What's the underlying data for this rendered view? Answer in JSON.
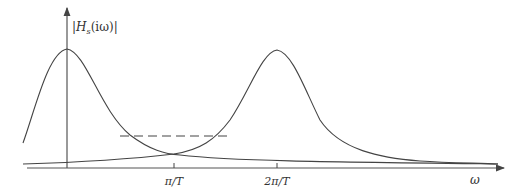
{
  "diagram": {
    "y_axis_label": {
      "bar_open": "|",
      "H": "H",
      "sub": "s",
      "arg": "(iω)",
      "bar_close": "|"
    },
    "x_axis_label": "ω",
    "ticks": [
      {
        "label": "π/T",
        "x": 174
      },
      {
        "label": "2π/T",
        "x": 277
      }
    ],
    "curves": [
      {
        "name": "baseband-response",
        "peak_x": 67,
        "peak_y": 49
      },
      {
        "name": "shifted-response",
        "peak_x": 277,
        "peak_y": 50
      }
    ],
    "dashed_line": {
      "x1": 120,
      "x2": 228,
      "y": 136
    },
    "colors": {
      "line": "#444444",
      "background": "#ffffff"
    }
  }
}
